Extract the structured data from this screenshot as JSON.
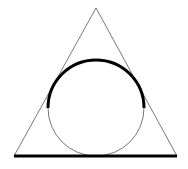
{
  "diagram": {
    "title": "",
    "colors": {
      "background": "#ffffff",
      "stroke": "#000000",
      "thin_stroke": "#555555"
    },
    "triangle": {
      "apex": [
        96,
        8
      ],
      "base_left": [
        14,
        156
      ],
      "base_right": [
        177,
        156
      ],
      "stroke_width": 0.8
    },
    "base_highlight": {
      "from": [
        14,
        156
      ],
      "to": [
        177,
        156
      ],
      "stroke_width": 3
    },
    "incircle": {
      "cx": 96,
      "cy": 108,
      "r": 48,
      "stroke_width": 0.8
    },
    "upper_arc_highlight": {
      "cx": 96,
      "cy": 108,
      "r": 48,
      "start_deg": 180,
      "end_deg": 360,
      "stroke_width": 3
    }
  }
}
